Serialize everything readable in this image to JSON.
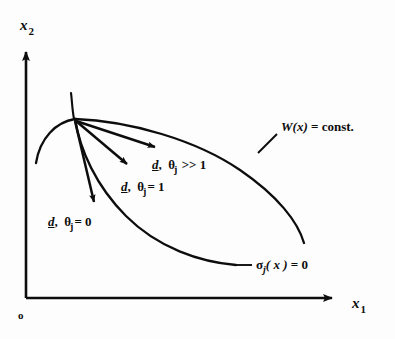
{
  "figure": {
    "background_color": "#fdfdfd",
    "ink_color": "#0d0d0d",
    "width": 395,
    "height": 339
  },
  "axes": {
    "y_axis": {
      "name": "x2-axis",
      "symbol": "x",
      "subscript": "2"
    },
    "x_axis": {
      "name": "x1-axis",
      "symbol": "x",
      "subscript": "1"
    },
    "origin": {
      "label": "o"
    }
  },
  "curves": [
    {
      "id": "objective-contour",
      "label_symbol": "W",
      "label_arg": "(x)",
      "label_eq": " = const.",
      "label_full": "W(x) = const."
    },
    {
      "id": "constraint-curve",
      "label_symbol": "σ",
      "label_sub": "j",
      "label_arg": "( x )",
      "label_eq": " = 0",
      "label_full": "σj( x ) = 0"
    }
  ],
  "directions": [
    {
      "id": "theta-much-greater-than-one",
      "vector": "d",
      "comma": ",",
      "theta": "θ",
      "subscript": "j",
      "relation": " >> 1",
      "full": "d,  θj >> 1"
    },
    {
      "id": "theta-equals-one",
      "vector": "d",
      "comma": ",",
      "theta": "θ",
      "subscript": "j",
      "relation": "= 1",
      "full": "d,  θj = 1"
    },
    {
      "id": "theta-equals-zero",
      "vector": "d",
      "comma": ",",
      "theta": "θ",
      "subscript": "j",
      "relation": "= 0",
      "full": "d,  θj = 0"
    }
  ]
}
